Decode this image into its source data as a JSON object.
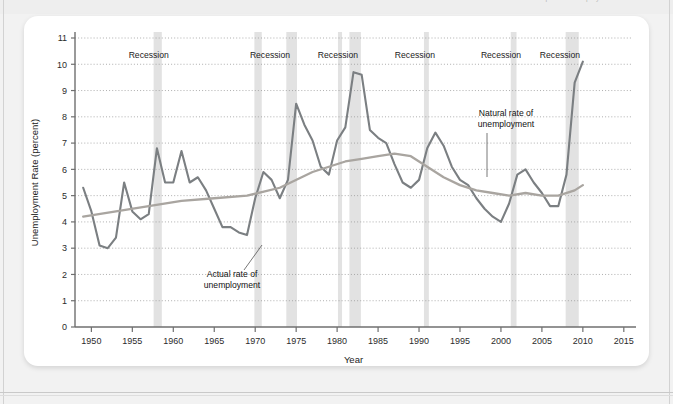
{
  "page": {
    "cut_off_header_text": "Chapter 8  Unemployment and Inflation"
  },
  "figure": {
    "y_axis_title": "Unemployment Rate (percent)",
    "x_axis_title": "Year",
    "recession_label": "Recession",
    "annotations": [
      {
        "id": "actual",
        "text_line1": "Actual rate of",
        "text_line2": "unemployment"
      },
      {
        "id": "natural",
        "text_line1": "Natural rate of",
        "text_line2": "unemployment"
      }
    ]
  },
  "chart_data": {
    "type": "line",
    "title": "",
    "xlabel": "Year",
    "ylabel": "Unemployment Rate (percent)",
    "xlim": [
      1948,
      2016
    ],
    "ylim": [
      0,
      11
    ],
    "xticks": [
      1950,
      1955,
      1960,
      1965,
      1970,
      1975,
      1980,
      1985,
      1990,
      1995,
      2000,
      2005,
      2010,
      2015
    ],
    "yticks": [
      0,
      1,
      2,
      3,
      4,
      5,
      6,
      7,
      8,
      9,
      10,
      11
    ],
    "grid": "horizontal-dotted",
    "legend": "inline-annotations",
    "recession_bands": [
      {
        "label": "Recession",
        "start": 1957.6,
        "end": 1958.6,
        "label_x": 1957.0
      },
      {
        "label": "Recession",
        "start": 1969.9,
        "end": 1970.8,
        "label_x": 1971.8
      },
      {
        "label": "Recession",
        "start": 1973.8,
        "end": 1975.1,
        "label_x": 1971.8
      },
      {
        "label": "Recession",
        "start": 1980.1,
        "end": 1980.6,
        "label_x": 1980.1
      },
      {
        "label": "Recession",
        "start": 1981.5,
        "end": 1982.9,
        "label_x": 1980.1
      },
      {
        "label": "Recession",
        "start": 1990.6,
        "end": 1991.2,
        "label_x": 1989.5
      },
      {
        "label": "Recession",
        "start": 2001.2,
        "end": 2001.9,
        "label_x": 2000.0
      },
      {
        "label": "Recession",
        "start": 2007.9,
        "end": 2009.5,
        "label_x": 2007.2
      }
    ],
    "series": [
      {
        "name": "Actual rate of unemployment",
        "color": "#7b7f82",
        "x": [
          1949,
          1950,
          1951,
          1952,
          1953,
          1954,
          1955,
          1956,
          1957,
          1958,
          1959,
          1960,
          1961,
          1962,
          1963,
          1964,
          1965,
          1966,
          1967,
          1968,
          1969,
          1970,
          1971,
          1972,
          1973,
          1974,
          1975,
          1976,
          1977,
          1978,
          1979,
          1980,
          1981,
          1982,
          1983,
          1984,
          1985,
          1986,
          1987,
          1988,
          1989,
          1990,
          1991,
          1992,
          1993,
          1994,
          1995,
          1996,
          1997,
          1998,
          1999,
          2000,
          2001,
          2002,
          2003,
          2004,
          2005,
          2006,
          2007,
          2008,
          2009,
          2010
        ],
        "y": [
          5.3,
          4.4,
          3.1,
          3.0,
          3.4,
          5.5,
          4.4,
          4.1,
          4.3,
          6.8,
          5.5,
          5.5,
          6.7,
          5.5,
          5.7,
          5.2,
          4.5,
          3.8,
          3.8,
          3.6,
          3.5,
          4.9,
          5.9,
          5.6,
          4.9,
          5.6,
          8.5,
          7.7,
          7.1,
          6.1,
          5.8,
          7.1,
          7.6,
          9.7,
          9.6,
          7.5,
          7.2,
          7.0,
          6.2,
          5.5,
          5.3,
          5.6,
          6.8,
          7.4,
          6.9,
          6.1,
          5.6,
          5.4,
          4.9,
          4.5,
          4.2,
          4.0,
          4.7,
          5.8,
          6.0,
          5.5,
          5.1,
          4.6,
          4.6,
          5.8,
          9.3,
          10.1
        ]
      },
      {
        "name": "Natural rate of unemployment",
        "color": "#a9a5a0",
        "x": [
          1949,
          1953,
          1957,
          1961,
          1965,
          1969,
          1973,
          1977,
          1981,
          1983,
          1985,
          1987,
          1989,
          1991,
          1993,
          1995,
          1997,
          1999,
          2001,
          2003,
          2005,
          2007,
          2009,
          2010
        ],
        "y": [
          4.2,
          4.4,
          4.6,
          4.8,
          4.9,
          5.0,
          5.3,
          5.9,
          6.3,
          6.4,
          6.5,
          6.6,
          6.5,
          6.1,
          5.7,
          5.4,
          5.2,
          5.1,
          5.0,
          5.1,
          5.0,
          5.0,
          5.2,
          5.4
        ]
      }
    ]
  }
}
